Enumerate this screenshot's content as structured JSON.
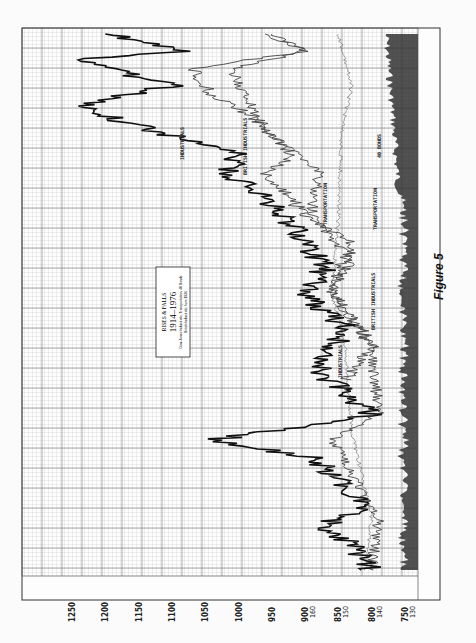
{
  "figure": {
    "caption": "Figure 5",
    "title_box": {
      "line1": "RISES & FALLS",
      "line2": "1914–1976",
      "line3": "Dow-Jones Industrials, Transportation, 40 Bonds",
      "line4": "British Industrials from 1936"
    },
    "series_labels": {
      "industrials_upper": "INDUSTRIALS",
      "british_industrials_upper": "BRITISH INDUSTRIALS",
      "transportation_upper": "TRANSPORTATION",
      "bonds_upper": "40 BONDS",
      "transportation_mid": "TRANSPORTATION",
      "british_industrials_lower": "BRITISH INDUSTRIALS",
      "industrials_lower": "INDUSTRIALS"
    },
    "value_axis_labels": [
      {
        "main": "1250",
        "sub": ""
      },
      {
        "main": "1200",
        "sub": ""
      },
      {
        "main": "1150",
        "sub": ""
      },
      {
        "main": "1100",
        "sub": ""
      },
      {
        "main": "1050",
        "sub": ""
      },
      {
        "main": "1000",
        "sub": ""
      },
      {
        "main": "950",
        "sub": ""
      },
      {
        "main": "900",
        "sub": "160"
      },
      {
        "main": "850",
        "sub": "150"
      },
      {
        "main": "800",
        "sub": "140"
      },
      {
        "main": "750",
        "sub": "130"
      }
    ]
  },
  "chart_data": {
    "type": "line",
    "title": "RISES & FALLS 1914–1976",
    "subtitle": "Dow-Jones Industrials, Transportation, 40 Bonds; British Industrials from 1936",
    "orientation": "rotated 90° counter-clockwise on page",
    "xlabel": "Year",
    "ylabel": "Index level",
    "x_range": [
      1914,
      1976
    ],
    "ylim": [
      750,
      1250
    ],
    "secondary_ylim": [
      130,
      160
    ],
    "grid": true,
    "legend_position": "inline labels",
    "y_ticks": [
      750,
      800,
      850,
      900,
      950,
      1000,
      1050,
      1100,
      1150,
      1200,
      1250
    ],
    "secondary_y_ticks": [
      130,
      140,
      150,
      160
    ],
    "series": [
      {
        "name": "Industrials",
        "x": [
          1914,
          1917,
          1919,
          1921,
          1924,
          1927,
          1929,
          1932,
          1937,
          1942,
          1946,
          1949,
          1953,
          1957,
          1960,
          1962,
          1966,
          1968,
          1970,
          1973,
          1974,
          1976
        ],
        "values": [
          800,
          830,
          880,
          810,
          840,
          890,
          1040,
          800,
          880,
          840,
          900,
          870,
          910,
          960,
          1020,
          1000,
          1180,
          1230,
          1100,
          1250,
          1080,
          1200
        ]
      },
      {
        "name": "British Industrials",
        "x": [
          1936,
          1940,
          1946,
          1952,
          1955,
          1960,
          1962,
          1966,
          1969,
          1972,
          1974,
          1976
        ],
        "values": [
          840,
          800,
          860,
          830,
          900,
          960,
          920,
          970,
          1040,
          1070,
          900,
          960
        ]
      },
      {
        "name": "Transportation",
        "x": [
          1914,
          1920,
          1929,
          1932,
          1940,
          1946,
          1950,
          1955,
          1960,
          1965,
          1969,
          1972,
          1974,
          1976
        ],
        "values": [
          800,
          790,
          860,
          790,
          800,
          860,
          830,
          890,
          880,
          960,
          990,
          1010,
          900,
          950
        ]
      },
      {
        "name": "40 Bonds",
        "x": [
          1914,
          1920,
          1930,
          1940,
          1946,
          1955,
          1965,
          1970,
          1976
        ],
        "values": [
          810,
          800,
          830,
          840,
          860,
          850,
          845,
          830,
          850
        ]
      }
    ],
    "volume_band": "daily volume shown as dark band along baseline (right edge of page)"
  }
}
